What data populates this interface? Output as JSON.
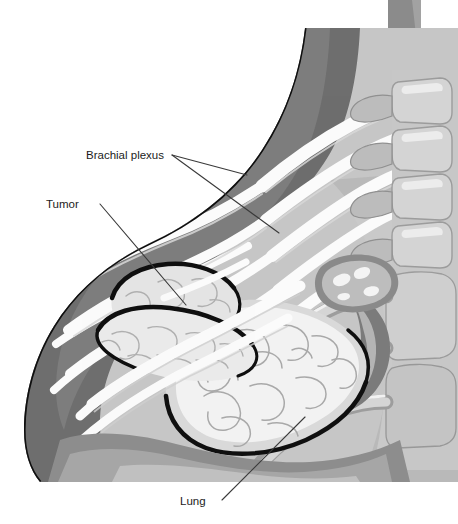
{
  "figure": {
    "background_color": "#ffffff",
    "width": 458,
    "height": 524
  },
  "labels": [
    {
      "id": "brachial-plexus",
      "text": "Brachial plexus",
      "text_x": 86,
      "text_y": 159,
      "leaders": [
        {
          "x1": 172,
          "y1": 155,
          "x2": 247,
          "y2": 175
        },
        {
          "x1": 172,
          "y1": 155,
          "x2": 279,
          "y2": 233
        }
      ]
    },
    {
      "id": "tumor",
      "text": "Tumor",
      "text_x": 46,
      "text_y": 208,
      "leaders": [
        {
          "x1": 100,
          "y1": 204,
          "x2": 186,
          "y2": 305
        }
      ]
    },
    {
      "id": "lung",
      "text": "Lung",
      "text_x": 180,
      "text_y": 505,
      "leaders": [
        {
          "x1": 222,
          "y1": 500,
          "x2": 305,
          "y2": 417
        }
      ]
    }
  ],
  "colors": {
    "label_text": "#1c1c1c",
    "leader_line": "#3a3a3a",
    "outline_dark": "#111111",
    "muscle_dark": "#6e6e6e",
    "muscle_mid": "#8f8f8f",
    "muscle_light": "#a8a8a8",
    "soft_tissue": "#bdbdbd",
    "soft_tissue_light": "#cfcfcf",
    "pale_tissue": "#dcdcdc",
    "nerve_white": "#fbfbfb",
    "bone_light": "#d2d2d2",
    "bone_mid": "#b2b2b2",
    "lung_fill": "#f2f2f2",
    "lung_shade": "#d8d8d8",
    "tumor_fill": "#e9e9e9",
    "vessel_line": "#9a9a9a"
  },
  "structures": [
    {
      "id": "body-wall",
      "name": "Chest wall / soft tissue envelope"
    },
    {
      "id": "chest-wall-muscle",
      "name": "Chest wall musculature"
    },
    {
      "id": "brachial-plexus-nerves",
      "name": "Brachial plexus nerve roots and trunks"
    },
    {
      "id": "vertebral-column",
      "name": "Thoracic vertebral column"
    },
    {
      "id": "ribs",
      "name": "Posterior ribs"
    },
    {
      "id": "tumor-mass",
      "name": "Apical (Pancoast) tumor mass"
    },
    {
      "id": "lung-apex",
      "name": "Lung apex"
    },
    {
      "id": "vessel-oval",
      "name": "Vessel cross-section"
    },
    {
      "id": "top-right-structure",
      "name": "Superior soft tissue block"
    }
  ]
}
